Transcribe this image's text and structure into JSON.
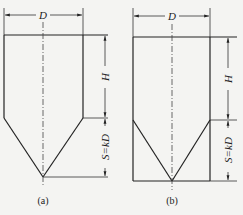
{
  "figures": [
    {
      "id": "a",
      "caption": "(a)",
      "labels": {
        "diameter": "D",
        "height": "H",
        "cone": "S=kD"
      },
      "description": "Vessel with cylindrical body and conical bottom; cone sides do not reach wall bottom"
    },
    {
      "id": "b",
      "caption": "(b)",
      "labels": {
        "diameter": "D",
        "height": "H",
        "cone": "S=kD"
      },
      "description": "Vessel with cylindrical walls extending to base, inner conical bottom"
    }
  ]
}
